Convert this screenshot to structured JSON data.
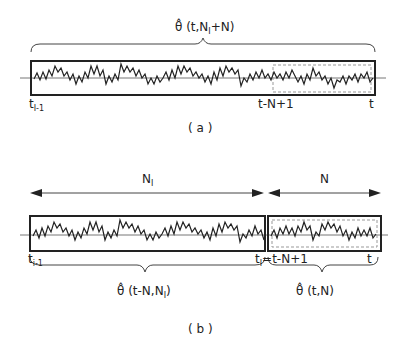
{
  "panel_a": {
    "estimate_label": "θ̂ (t,N",
    "estimate_sub": "I",
    "estimate_tail": "+N)",
    "left_tick": "t",
    "left_tick_sub": "I-1",
    "mid_tick": "t-N+1",
    "right_tick": "t",
    "caption": "( a )"
  },
  "panel_b": {
    "span_left_label": "N",
    "span_left_sub": "I",
    "span_right_label": "N",
    "left_tick": "t",
    "left_tick_sub": "i-1",
    "mid_tick": "t",
    "mid_tick_sub": "I",
    "mid_tick_tail": "=t-N+1",
    "right_tick": "t",
    "estimate_left_label": "θ̂ (t-N,N",
    "estimate_left_sub": "I",
    "estimate_left_tail": ")",
    "estimate_right_label": "θ̂ (t,N)",
    "caption": "( b )"
  },
  "colors": {
    "stroke": "#222222",
    "axis": "#777777",
    "dashed": "#999999"
  }
}
